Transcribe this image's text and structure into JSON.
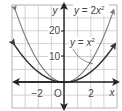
{
  "chart_data": {
    "type": "line",
    "title": "",
    "xlabel": "x",
    "ylabel": "y",
    "xlim": [
      -4,
      4
    ],
    "ylim": [
      -10,
      30
    ],
    "grid": true,
    "x_grid_step": 1,
    "y_grid_step": 5,
    "x_tick_labels": [
      {
        "value": -2,
        "label": "−2"
      },
      {
        "value": 0,
        "label": "O"
      },
      {
        "value": 2,
        "label": "2"
      }
    ],
    "y_tick_labels": [
      {
        "value": 10,
        "label": "10"
      },
      {
        "value": 20,
        "label": "20"
      }
    ],
    "series": [
      {
        "name": "y = x²",
        "color": "#333333",
        "x": [
          -4,
          -3,
          -2,
          -1,
          0,
          1,
          2,
          3,
          4
        ],
        "y": [
          16,
          9,
          4,
          1,
          0,
          1,
          4,
          9,
          16
        ]
      },
      {
        "name": "y = 2x²",
        "color": "#7a7a7a",
        "x": [
          -3.8,
          -3,
          -2,
          -1,
          0,
          1,
          2,
          3,
          3.8
        ],
        "y": [
          28.9,
          18,
          8,
          2,
          0,
          2,
          8,
          18,
          28.9
        ]
      }
    ],
    "annotations": [
      {
        "text": "y = 2x²",
        "position": "top-right"
      },
      {
        "text": "y = x²",
        "position": "right, leader line to curve"
      }
    ]
  },
  "labels": {
    "x_axis": "x",
    "y_axis": "y",
    "origin": "O",
    "x_neg2": "−2",
    "x_pos2": "2",
    "y_10": "10",
    "y_20": "20",
    "curve_2x2_prefix": "y = 2x",
    "curve_x2_prefix": "y = x",
    "sup": "2"
  },
  "colors": {
    "grid": "#c8c8c8",
    "axis": "#222222",
    "curve_x2": "#333333",
    "curve_2x2": "#7a7a7a",
    "text": "#444444"
  }
}
